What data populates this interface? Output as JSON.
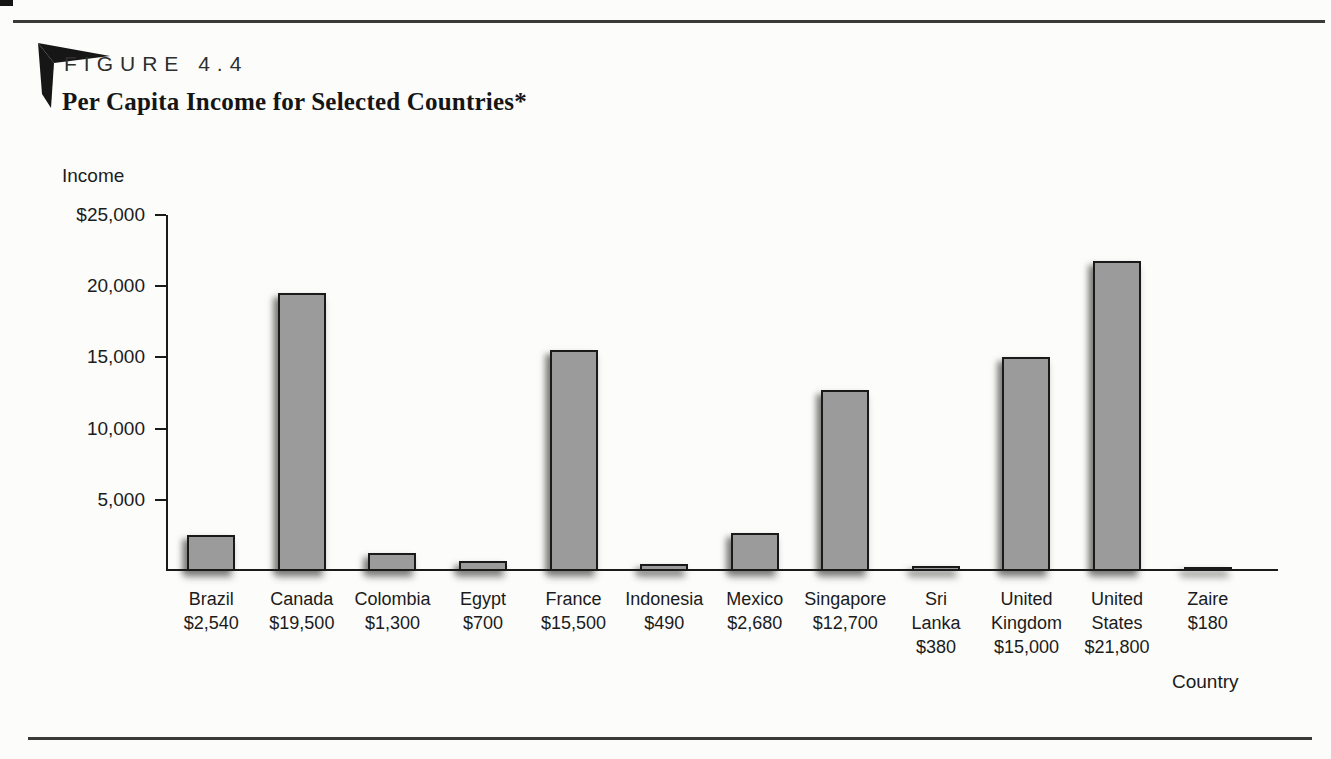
{
  "figure": {
    "label": "FIGURE 4.4",
    "title": "Per Capita Income for Selected Countries*"
  },
  "chart_data": {
    "type": "bar",
    "title": "Per Capita Income for Selected Countries*",
    "xlabel": "Country",
    "ylabel": "Income",
    "ylim": [
      0,
      25000
    ],
    "grid": false,
    "legend": false,
    "yticks": [
      {
        "value": 25000,
        "label": "$25,000"
      },
      {
        "value": 20000,
        "label": "20,000"
      },
      {
        "value": 15000,
        "label": "15,000"
      },
      {
        "value": 10000,
        "label": "10,000"
      },
      {
        "value": 5000,
        "label": "5,000"
      }
    ],
    "categories": [
      "Brazil",
      "Canada",
      "Colombia",
      "Egypt",
      "France",
      "Indonesia",
      "Mexico",
      "Singapore",
      "Sri Lanka",
      "United Kingdom",
      "United States",
      "Zaire"
    ],
    "display_names": [
      "Brazil",
      "Canada",
      "Colombia",
      "Egypt",
      "France",
      "Indonesia",
      "Mexico",
      "Singapore",
      "Sri\nLanka",
      "United\nKingdom",
      "United\nStates",
      "Zaire"
    ],
    "values": [
      2540,
      19500,
      1300,
      700,
      15500,
      490,
      2680,
      12700,
      380,
      15000,
      21800,
      180
    ],
    "value_labels": [
      "$2,540",
      "$19,500",
      "$1,300",
      "$700",
      "$15,500",
      "$490",
      "$2,680",
      "$12,700",
      "$380",
      "$15,000",
      "$21,800",
      "$180"
    ],
    "colors": {
      "bar_fill": "#9b9b9b",
      "bar_border": "#1a1a1a",
      "axis": "#1a1a1a",
      "text": "#1b1b1b",
      "rule": "#3a3a3a"
    }
  }
}
